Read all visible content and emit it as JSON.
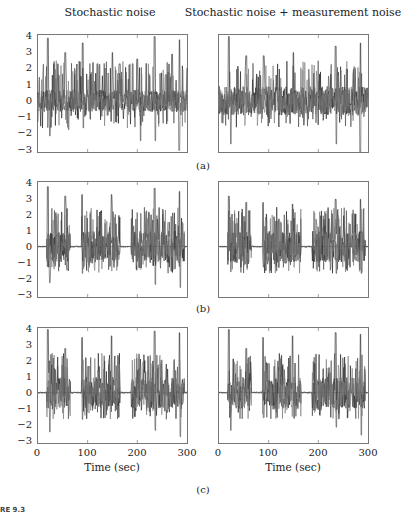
{
  "columns": {
    "left_title": "Stochastic noise",
    "right_title": "Stochastic noise + measurement noise"
  },
  "panel_labels": [
    "(a)",
    "(b)",
    "(c)"
  ],
  "y_ticks": [
    "4",
    "3",
    "2",
    "1",
    "0",
    "−1",
    "−2",
    "−3"
  ],
  "x_ticks": [
    "0",
    "100",
    "200",
    "300"
  ],
  "x_label": "Time (sec)",
  "caption_fragment": "RE 9.3",
  "colors": {
    "line": "#1a1a1a",
    "axis": "#777777",
    "zero_line": "#888888"
  },
  "chart_data": [
    {
      "type": "line",
      "panel": "a",
      "column": "left",
      "title": "Stochastic noise",
      "xlabel": "",
      "ylabel": "",
      "xlim": [
        0,
        300
      ],
      "ylim": [
        -3.2,
        4.1
      ],
      "description": "Continuous dense noise around 0, peaks up to ~4",
      "peaks": [
        [
          20,
          3.9
        ],
        [
          32,
          2.3
        ],
        [
          40,
          2.3
        ],
        [
          55,
          3.0
        ],
        [
          90,
          3.6
        ],
        [
          120,
          2.3
        ],
        [
          150,
          3.0
        ],
        [
          165,
          2.3
        ],
        [
          200,
          2.6
        ],
        [
          235,
          4.0
        ],
        [
          270,
          2.9
        ],
        [
          285,
          3.8
        ]
      ],
      "troughs": [
        [
          22,
          -2.2
        ],
        [
          60,
          -1.8
        ],
        [
          90,
          -1.7
        ],
        [
          205,
          -2.5
        ],
        [
          235,
          -2.5
        ],
        [
          283,
          -3.1
        ]
      ]
    },
    {
      "type": "line",
      "panel": "a",
      "column": "right",
      "title": "Stochastic noise + measurement noise",
      "xlim": [
        0,
        300
      ],
      "ylim": [
        -3.2,
        4.1
      ],
      "description": "Continuous dense noise, slightly noisier, peaks ~4",
      "peaks": [
        [
          20,
          4.0
        ],
        [
          55,
          2.8
        ],
        [
          90,
          2.8
        ],
        [
          150,
          3.0
        ],
        [
          235,
          3.4
        ],
        [
          285,
          3.6
        ]
      ],
      "troughs": [
        [
          22,
          -2.7
        ],
        [
          235,
          -2.7
        ],
        [
          283,
          -3.2
        ]
      ]
    },
    {
      "type": "line",
      "panel": "b",
      "column": "left",
      "xlim": [
        0,
        300
      ],
      "ylim": [
        -3.2,
        4.1
      ],
      "description": "Burst signal: active at ~18-65, 88-165, 188-265, 268-295; flat 0 between",
      "bursts": [
        [
          18,
          65
        ],
        [
          88,
          165
        ],
        [
          188,
          265
        ],
        [
          268,
          295
        ]
      ],
      "peaks": [
        [
          20,
          3.8
        ],
        [
          55,
          3.2
        ],
        [
          88,
          3.3
        ],
        [
          148,
          3.3
        ],
        [
          235,
          3.7
        ],
        [
          285,
          3.5
        ]
      ],
      "troughs": [
        [
          22,
          -2.3
        ],
        [
          88,
          -1.7
        ],
        [
          235,
          -2.4
        ],
        [
          285,
          -2.6
        ]
      ]
    },
    {
      "type": "line",
      "panel": "b",
      "column": "right",
      "xlim": [
        0,
        300
      ],
      "ylim": [
        -3.2,
        4.1
      ],
      "bursts": [
        [
          18,
          65
        ],
        [
          88,
          165
        ],
        [
          188,
          265
        ],
        [
          268,
          295
        ]
      ],
      "peaks": [
        [
          20,
          3.2
        ],
        [
          55,
          2.8
        ],
        [
          88,
          2.8
        ],
        [
          148,
          2.7
        ],
        [
          235,
          3.0
        ],
        [
          285,
          3.0
        ]
      ],
      "troughs": [
        [
          22,
          -1.6
        ],
        [
          88,
          -1.3
        ],
        [
          235,
          -1.7
        ],
        [
          285,
          -1.7
        ]
      ]
    },
    {
      "type": "line",
      "panel": "c",
      "column": "left",
      "xlabel": "Time (sec)",
      "xlim": [
        0,
        300
      ],
      "ylim": [
        -3.2,
        4.1
      ],
      "bursts": [
        [
          18,
          65
        ],
        [
          88,
          165
        ],
        [
          188,
          265
        ],
        [
          268,
          295
        ]
      ],
      "peaks": [
        [
          20,
          4.0
        ],
        [
          55,
          2.8
        ],
        [
          88,
          3.5
        ],
        [
          148,
          3.6
        ],
        [
          235,
          3.9
        ],
        [
          285,
          3.8
        ]
      ],
      "troughs": [
        [
          22,
          -2.5
        ],
        [
          88,
          -1.7
        ],
        [
          235,
          -2.4
        ],
        [
          285,
          -2.8
        ]
      ]
    },
    {
      "type": "line",
      "panel": "c",
      "column": "right",
      "xlabel": "Time (sec)",
      "xlim": [
        0,
        300
      ],
      "ylim": [
        -3.2,
        4.1
      ],
      "bursts": [
        [
          18,
          65
        ],
        [
          88,
          165
        ],
        [
          188,
          265
        ],
        [
          268,
          295
        ]
      ],
      "peaks": [
        [
          20,
          4.0
        ],
        [
          55,
          2.8
        ],
        [
          88,
          3.5
        ],
        [
          148,
          3.6
        ],
        [
          235,
          3.8
        ],
        [
          285,
          3.7
        ]
      ],
      "troughs": [
        [
          22,
          -2.4
        ],
        [
          88,
          -1.6
        ],
        [
          235,
          -2.2
        ],
        [
          285,
          -2.7
        ]
      ]
    }
  ]
}
